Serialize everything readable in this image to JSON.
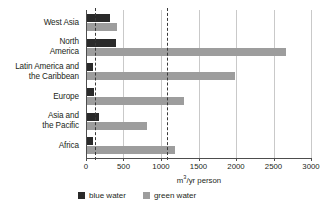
{
  "chart_data": {
    "type": "bar",
    "orientation": "horizontal",
    "title": "",
    "xlabel": "m³/yr person",
    "ylabel": "",
    "xlim": [
      0,
      3000
    ],
    "grid": true,
    "legend_position": "bottom",
    "categories": [
      "West Asia",
      "North\nAmerica",
      "Latin America and\nthe Caribbean",
      "Europe",
      "Asia and\nthe Pacific",
      "Africa"
    ],
    "series": [
      {
        "name": "blue water",
        "color": "#2a2a2a",
        "values": [
          320,
          400,
          90,
          110,
          170,
          95
        ]
      },
      {
        "name": "green water",
        "color": "#9d9d9d",
        "values": [
          410,
          2660,
          1990,
          1300,
          810,
          1180
        ]
      }
    ],
    "xticks": [
      0,
      500,
      1000,
      1500,
      2000,
      2500,
      3000
    ],
    "xtick_labels": [
      "0",
      "500",
      "1000",
      "1500",
      "2000",
      "2500",
      "3000"
    ],
    "reference_lines": [
      {
        "name": "blue-water-threshold",
        "value": 120
      },
      {
        "name": "green-water-threshold",
        "value": 1080
      }
    ],
    "axis_unit_prefix": "m",
    "axis_unit_exponent": "3",
    "axis_unit_suffix": "/yr person"
  },
  "legend": {
    "items": [
      {
        "label": "blue water",
        "color": "#2a2a2a"
      },
      {
        "label": "green water",
        "color": "#9d9d9d"
      }
    ]
  }
}
